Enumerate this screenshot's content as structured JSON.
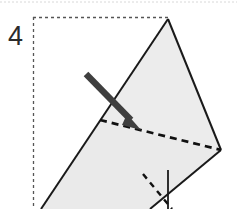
{
  "figure": {
    "kind": "origami-fold-step-diagram",
    "width": 237,
    "height": 209,
    "background_color": "#ffffff",
    "step_number": "4",
    "colors": {
      "paper_fill": "#ececec",
      "paper_stroke": "#1a1a1a",
      "fold_line": "#111111",
      "arrow": "#3f3f3f",
      "panel_border": "#555555",
      "top_rule": "#d8d8d8",
      "step_number_color": "#2b2b2b"
    },
    "panel": {
      "label": "step-panel",
      "x": 33,
      "y": 17,
      "right": 168,
      "bottom": 209,
      "border_style": "dashed",
      "dash_pattern": "3 3",
      "stroke_width": 1.2
    },
    "top_rule": {
      "label": "page-top-rule",
      "x1": 0,
      "y1": 2,
      "x2": 237,
      "y2": 2,
      "dash_pattern": "2 2",
      "stroke_width": 1
    },
    "shapes": {
      "upper_flap": {
        "label": "upper-triangle-flap",
        "points": "168,19 221,150 100,120",
        "fill": "#ececec",
        "stroke": "#1a1a1a",
        "stroke_width": 2
      },
      "lower_flap": {
        "label": "lower-paper-body",
        "points": "100,120 221,150 76,209 41,209",
        "fill": "#eaeaea",
        "stroke": "none"
      },
      "left_edge": {
        "label": "paper-left-edge",
        "x1": 168,
        "y1": 19,
        "x2": 41,
        "y2": 209,
        "stroke_width": 2
      },
      "lower_right_edge": {
        "label": "paper-lower-right-edge",
        "x1": 221,
        "y1": 150,
        "x2": 150,
        "y2": 209,
        "stroke_width": 2
      },
      "right_edge": {
        "label": "paper-right-edge",
        "x1": 168,
        "y1": 19,
        "x2": 221,
        "y2": 150,
        "stroke_width": 2
      }
    },
    "fold_line": {
      "label": "main-fold-crease",
      "style": "dashed",
      "x1": 100,
      "y1": 120,
      "x2": 221,
      "y2": 150,
      "dash_pattern": "7 5",
      "stroke_width": 2.6
    },
    "hidden_fold_line": {
      "label": "hidden-fold-crease",
      "style": "dashed",
      "x1": 143,
      "y1": 174,
      "x2": 172,
      "y2": 209,
      "dash_pattern": "6 5",
      "stroke_width": 2.4
    },
    "vertical_edge": {
      "label": "vertical-flap-edge",
      "x1": 168,
      "y1": 170,
      "x2": 168,
      "y2": 209,
      "stroke_width": 1.8
    },
    "fold_arrow": {
      "label": "fold-direction-arrow",
      "tail_x": 86,
      "tail_y": 74,
      "tip_x": 141,
      "tip_y": 130,
      "shaft_width": 6,
      "head_length": 17,
      "head_width": 15,
      "color": "#3f3f3f"
    }
  }
}
